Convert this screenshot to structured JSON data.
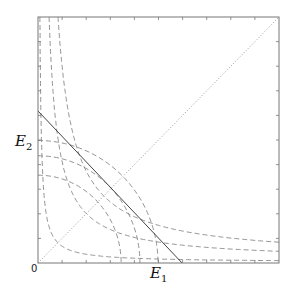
{
  "diagram": {
    "type": "phase-plane",
    "axes": {
      "x_label": {
        "base": "E",
        "sub": "1"
      },
      "y_label": {
        "base": "E",
        "sub": "2"
      },
      "origin_label": "0",
      "ticks_per_axis": 9,
      "box_color": "#777777"
    },
    "curves": {
      "diagonal": {
        "style": "dotted",
        "from": [
          0,
          0
        ],
        "to": [
          1,
          1
        ],
        "color": "#999999"
      },
      "budget_line": {
        "style": "solid",
        "from": [
          0,
          0.618
        ],
        "to": [
          0.598,
          0
        ],
        "color": "#444444"
      },
      "hyperbolas": [
        {
          "style": "dashed",
          "top_x": 0.008,
          "right_y": 0.017
        },
        {
          "style": "dashed",
          "top_x": 0.046,
          "right_y": 0.054
        },
        {
          "style": "dashed",
          "top_x": 0.083,
          "right_y": 0.091
        }
      ],
      "arcs": [
        {
          "style": "dashed",
          "radius_x": 0.345,
          "radius_y": 0.357
        },
        {
          "style": "dashed",
          "radius_x": 0.423,
          "radius_y": 0.436
        },
        {
          "style": "dashed",
          "radius_x": 0.498,
          "radius_y": 0.498
        }
      ],
      "dash_color": "#888888"
    }
  }
}
